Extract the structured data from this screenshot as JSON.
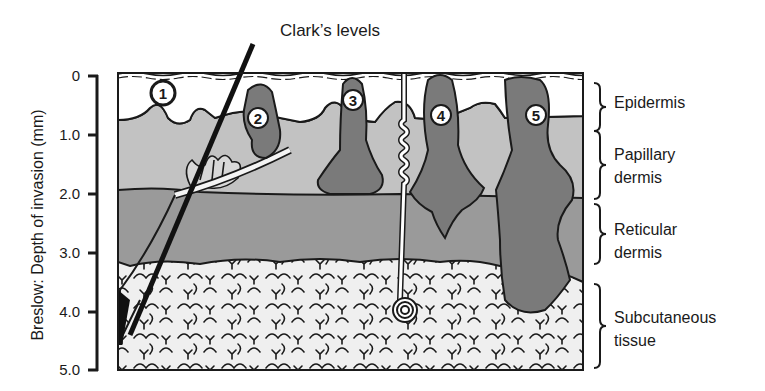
{
  "title": "Clark’s levels",
  "axis": {
    "title": "Breslow: Depth of invasion (mm)",
    "ticks": [
      "0",
      "1.0",
      "2.0",
      "3.0",
      "4.0",
      "5.0"
    ]
  },
  "layers": [
    {
      "label_line1": "Epidermis",
      "label_line2": "",
      "color": "#ffffff"
    },
    {
      "label_line1": "Papillary",
      "label_line2": "dermis",
      "color": "#c2c2c2"
    },
    {
      "label_line1": "Reticular",
      "label_line2": "dermis",
      "color": "#9a9a9a"
    },
    {
      "label_line1": "Subcutaneous",
      "label_line2": "tissue",
      "color": "#efefef"
    }
  ],
  "clark_levels": [
    "1",
    "2",
    "3",
    "4",
    "5"
  ],
  "colors": {
    "tumor": "#7a7a7a",
    "outline": "#1a1a1a",
    "hair": "#111111"
  }
}
